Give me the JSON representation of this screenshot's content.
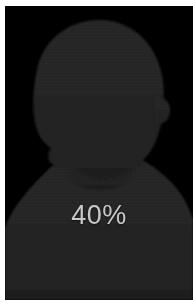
{
  "image": {
    "width": 193,
    "height": 302,
    "matte_color": "#ffffff",
    "background_color": "#000000"
  },
  "subject": {
    "type": "person-silhouette",
    "description": "head-and-shoulders silhouette",
    "fill_color": "#262626",
    "edge_color": "#1d1d1d"
  },
  "overlay": {
    "percent_label": "40%",
    "percent_value": 40,
    "text_color": "#c9c9c9"
  }
}
